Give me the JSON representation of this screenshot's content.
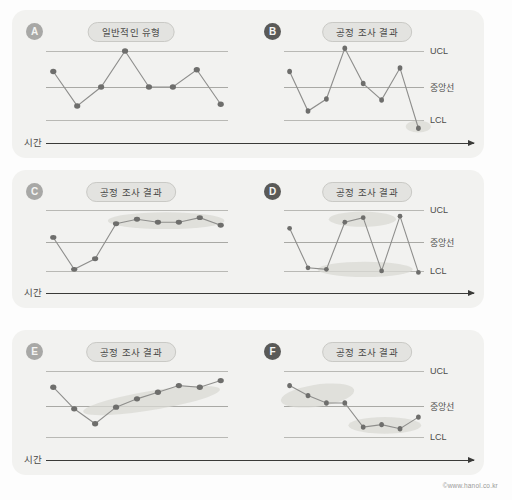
{
  "figure": {
    "axis_label": "시간",
    "credit": "©www.hanol.co.kr",
    "ref_labels": {
      "ucl": "UCL",
      "center": "중앙선",
      "lcl": "LCL"
    }
  },
  "panels": [
    {
      "letter": "A",
      "title": "일반적인 유형",
      "badge_dark": false,
      "show_ref_labels": false,
      "show_axis": true,
      "values": [
        68,
        28,
        50,
        92,
        50,
        50,
        70,
        30
      ],
      "ellipses": []
    },
    {
      "letter": "B",
      "title": "공정 조사 결과",
      "badge_dark": true,
      "show_ref_labels": true,
      "show_axis": false,
      "values": [
        68,
        22,
        36,
        95,
        54,
        35,
        72,
        2
      ],
      "ellipses": [
        {
          "cx": 96,
          "cy": 4,
          "rx": 9,
          "ry": 7,
          "rot": 0
        }
      ]
    },
    {
      "letter": "C",
      "title": "공정 조사 결과",
      "badge_dark": false,
      "show_ref_labels": false,
      "show_axis": true,
      "values": [
        56,
        14,
        28,
        74,
        80,
        76,
        76,
        82,
        72
      ],
      "ellipses": [
        {
          "cx": 66,
          "cy": 78,
          "rx": 32,
          "ry": 11,
          "rot": 0
        }
      ]
    },
    {
      "letter": "D",
      "title": "공정 조사 결과",
      "badge_dark": true,
      "show_ref_labels": true,
      "show_axis": false,
      "values": [
        68,
        16,
        14,
        76,
        82,
        12,
        84,
        10
      ],
      "ellipses": [
        {
          "cx": 56,
          "cy": 80,
          "rx": 24,
          "ry": 10,
          "rot": 0
        },
        {
          "cx": 58,
          "cy": 14,
          "rx": 34,
          "ry": 10,
          "rot": 0
        }
      ]
    },
    {
      "letter": "E",
      "title": "공정 조사 결과",
      "badge_dark": false,
      "show_ref_labels": false,
      "show_axis": true,
      "values": [
        72,
        46,
        28,
        48,
        58,
        66,
        74,
        72,
        80
      ],
      "ellipses": [
        {
          "cx": 58,
          "cy": 56,
          "rx": 40,
          "ry": 11,
          "rot": -21
        }
      ]
    },
    {
      "letter": "F",
      "title": "공정 조사 결과",
      "badge_dark": true,
      "show_ref_labels": true,
      "show_axis": false,
      "values": [
        74,
        62,
        53,
        53,
        24,
        27,
        22,
        36
      ],
      "ellipses": [
        {
          "cx": 24,
          "cy": 62,
          "rx": 27,
          "ry": 13,
          "rot": -16
        },
        {
          "cx": 72,
          "cy": 26,
          "rx": 26,
          "ry": 10,
          "rot": 0
        }
      ]
    }
  ]
}
